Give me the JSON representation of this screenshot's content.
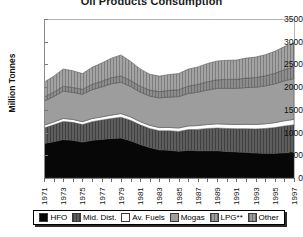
{
  "chart_data": {
    "type": "area",
    "title": "Oil Products Consumption",
    "xlabel": "",
    "ylabel": "Million Tonnes",
    "ylim": [
      0,
      3500
    ],
    "ytick_step": 500,
    "yticks": [
      "3500",
      "3000",
      "2500",
      "2000",
      "1500",
      "1000",
      "500",
      "0"
    ],
    "grid": false,
    "legend_position": "bottom",
    "stacked": true,
    "x": [
      1971,
      1972,
      1973,
      1974,
      1975,
      1976,
      1977,
      1978,
      1979,
      1980,
      1981,
      1982,
      1983,
      1984,
      1985,
      1986,
      1987,
      1988,
      1989,
      1990,
      1991,
      1992,
      1993,
      1994,
      1995,
      1996,
      1997
    ],
    "xtick_labels": [
      "1971",
      "1973",
      "1975",
      "1977",
      "1979",
      "1981",
      "1983",
      "1985",
      "1987",
      "1989",
      "1991",
      "1993",
      "1995",
      "1997"
    ],
    "series": [
      {
        "name": "HFO",
        "color": "#070707",
        "pattern": "solid",
        "values": [
          760,
          800,
          845,
          830,
          790,
          830,
          850,
          870,
          880,
          820,
          740,
          670,
          620,
          610,
          590,
          610,
          600,
          600,
          600,
          585,
          575,
          565,
          550,
          545,
          545,
          555,
          560
        ]
      },
      {
        "name": "Mid. Dist.",
        "color": "#5e5e5e",
        "pattern": "vertical-lines",
        "values": [
          340,
          370,
          400,
          395,
          385,
          410,
          425,
          440,
          460,
          450,
          430,
          420,
          420,
          430,
          435,
          455,
          470,
          490,
          500,
          505,
          510,
          520,
          530,
          545,
          565,
          590,
          610
        ]
      },
      {
        "name": "Av. Fuels",
        "color": "#fbfbfb",
        "pattern": "solid",
        "values": [
          60,
          62,
          66,
          64,
          64,
          68,
          70,
          74,
          78,
          74,
          70,
          68,
          70,
          73,
          76,
          80,
          84,
          88,
          92,
          94,
          92,
          96,
          98,
          102,
          108,
          114,
          120
        ]
      },
      {
        "name": "Mogas",
        "color": "#9d9d9d",
        "pattern": "solid",
        "values": [
          530,
          560,
          600,
          595,
          605,
          635,
          660,
          690,
          690,
          670,
          650,
          645,
          655,
          670,
          690,
          715,
          735,
          760,
          780,
          790,
          795,
          810,
          820,
          835,
          855,
          880,
          900
        ]
      },
      {
        "name": "LPG**",
        "color": "#878787",
        "pattern": "vertical-lines",
        "values": [
          90,
          98,
          108,
          108,
          110,
          118,
          126,
          134,
          140,
          136,
          132,
          132,
          138,
          146,
          152,
          162,
          172,
          182,
          190,
          196,
          200,
          208,
          214,
          222,
          232,
          244,
          254
        ]
      },
      {
        "name": "Other",
        "color": "#9a9a9a",
        "pattern": "vertical-lines",
        "values": [
          330,
          350,
          380,
          370,
          345,
          375,
          400,
          430,
          460,
          420,
          380,
          350,
          340,
          350,
          355,
          375,
          385,
          400,
          415,
          420,
          425,
          440,
          450,
          465,
          485,
          510,
          535
        ]
      }
    ]
  },
  "legend": {
    "items": [
      {
        "label": "HFO"
      },
      {
        "label": "Mid. Dist."
      },
      {
        "label": "Av. Fuels"
      },
      {
        "label": "Mogas"
      },
      {
        "label": "LPG**"
      },
      {
        "label": "Other"
      }
    ]
  }
}
